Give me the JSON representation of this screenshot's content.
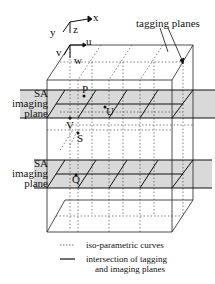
{
  "axes": {
    "x": "x",
    "y": "y",
    "z": "z"
  },
  "param_axes": {
    "u": "u",
    "v": "v",
    "w": "w"
  },
  "annotations": {
    "tagging_planes": "tagging planes",
    "sa_plane_1": [
      "SA",
      "imaging",
      "plane"
    ],
    "sa_plane_2": [
      "SA",
      "imaging",
      "plane"
    ]
  },
  "points": {
    "P": "P",
    "U": "U",
    "V": "V",
    "S": "S",
    "Q": "Q"
  },
  "legend": [
    {
      "symbol": "dotted",
      "label": "iso-parametric curves"
    },
    {
      "symbol": "solid",
      "label": "intersection of tagging and imaging planes",
      "line1": "intersection of tagging",
      "line2": "and imaging planes"
    }
  ]
}
